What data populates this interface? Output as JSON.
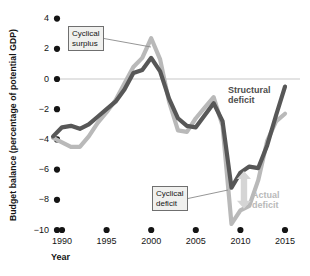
{
  "chart_data": {
    "type": "line",
    "title": "",
    "xlabel": "Year",
    "ylabel": "Budget balance (percentage of  potential GDP)",
    "xlim": [
      1989,
      2015.5
    ],
    "ylim": [
      -10,
      4
    ],
    "yticks": [
      4,
      2,
      0,
      -2,
      -4,
      -6,
      -8,
      -10
    ],
    "ytick_labels": [
      "4",
      "2",
      "0",
      "−2",
      "−4",
      "−6",
      "−8",
      "−10"
    ],
    "xticks": [
      1990,
      1995,
      2000,
      2005,
      2010,
      2015
    ],
    "xtick_labels": [
      "1990",
      "1995",
      "2000",
      "2005",
      "2010",
      "2015"
    ],
    "grid": false,
    "zero_line": true,
    "legend_position": "inline-annotations",
    "series": [
      {
        "name": "Structural deficit",
        "color": "#575757",
        "x": [
          1989,
          1990,
          1991,
          1992,
          1993,
          1994,
          1995,
          1996,
          1997,
          1998,
          1999,
          2000,
          2001,
          2002,
          2003,
          2004,
          2005,
          2006,
          2007,
          2008,
          2009,
          2010,
          2011,
          2012,
          2013,
          2014,
          2015
        ],
        "values": [
          -3.8,
          -3.2,
          -3.1,
          -3.3,
          -3.0,
          -2.5,
          -2.0,
          -1.5,
          -0.7,
          0.4,
          0.6,
          1.4,
          0.5,
          -1.3,
          -2.6,
          -3.1,
          -3.2,
          -2.4,
          -1.6,
          -2.8,
          -7.2,
          -6.2,
          -5.8,
          -5.9,
          -4.4,
          -2.4,
          -0.5
        ]
      },
      {
        "name": "Actual deficit",
        "color": "#b9b9b9",
        "x": [
          1989,
          1990,
          1991,
          1992,
          1993,
          1994,
          1995,
          1996,
          1997,
          1998,
          1999,
          2000,
          2001,
          2002,
          2003,
          2004,
          2005,
          2006,
          2007,
          2008,
          2009,
          2010,
          2011,
          2012,
          2013,
          2014,
          2015
        ],
        "values": [
          -3.9,
          -4.2,
          -4.5,
          -4.5,
          -3.8,
          -2.9,
          -2.2,
          -1.4,
          -0.3,
          0.8,
          1.4,
          2.7,
          1.3,
          -1.5,
          -3.4,
          -3.5,
          -2.6,
          -1.9,
          -1.2,
          -3.1,
          -9.6,
          -8.7,
          -8.4,
          -6.7,
          -4.1,
          -2.8,
          -2.3
        ]
      }
    ],
    "annotations": [
      {
        "name": "cyclical-surplus",
        "text": "Cyclical\nsurplus",
        "box_x": 68,
        "box_y": 26,
        "target_x": 151,
        "target_y": 47
      },
      {
        "name": "cyclical-deficit",
        "text": "Cyclical\ndeficit",
        "box_x": 152,
        "box_y": 186,
        "target_x": 228,
        "target_y": 190
      }
    ],
    "series_labels": [
      {
        "name": "structural-deficit-label",
        "text": "Structural\ndeficit",
        "color": "#4d4d4d"
      },
      {
        "name": "actual-deficit-label",
        "text": "Actual\ndeficit",
        "color": "#b9b9b9"
      }
    ],
    "gap_arrow": {
      "name": "cyclical-deficit-gap-arrow",
      "color": "#d5d5d5",
      "x": 2010.4,
      "y_top": -6.1,
      "y_bottom": -8.6
    }
  },
  "colors": {
    "structural": "#575757",
    "actual": "#b9b9b9",
    "axis": "#141414",
    "zero_line": "#c8c8c8",
    "anno_box_bg": "#f0f0ee",
    "anno_box_border": "#6f6f6f",
    "leader_line": "#8a8a8a"
  }
}
